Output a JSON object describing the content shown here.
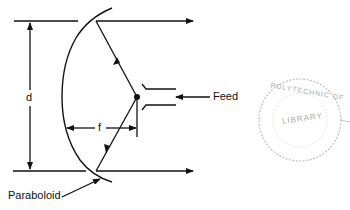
{
  "diagram": {
    "labels": {
      "diameter": "d",
      "focal_length": "f",
      "feed": "Feed",
      "reflector": "Paraboloid"
    },
    "stamp": {
      "text_top": "POLYTECHNIC OF",
      "text_center": "LIBRARY",
      "text_bottom": "...",
      "color": "#9a9a9a"
    },
    "colors": {
      "line": "#111111",
      "background": "#ffffff"
    }
  }
}
